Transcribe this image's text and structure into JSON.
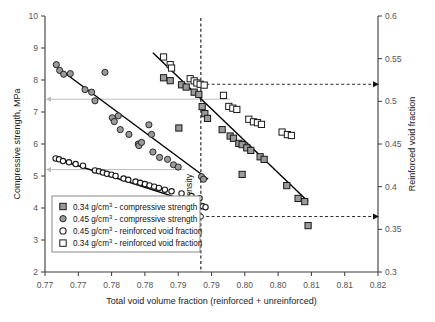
{
  "chart_data": {
    "type": "scatter",
    "title": "",
    "xlabel": "Total void volume fraction (reinforced + unreinforced)",
    "ylabel": "Compressive strength, MPa",
    "y2label": "Reinforced void fraction",
    "xlim": [
      0.77,
      0.82
    ],
    "ylim": [
      2,
      10
    ],
    "y2lim": [
      0.3,
      0.6
    ],
    "xticks": [
      "0.77",
      "0.77",
      "0.78",
      "0.78",
      "0.79",
      "0.79",
      "0.80",
      "0.80",
      "0.81",
      "0.81",
      "0.82"
    ],
    "xtick_values": [
      0.77,
      0.775,
      0.78,
      0.785,
      0.79,
      0.795,
      0.8,
      0.805,
      0.81,
      0.815,
      0.82
    ],
    "yticks": [
      "2",
      "3",
      "4",
      "5",
      "6",
      "7",
      "8",
      "9",
      "10"
    ],
    "ytick_values": [
      2,
      3,
      4,
      5,
      6,
      7,
      8,
      9,
      10
    ],
    "y2ticks": [
      "0.3",
      "0.35",
      "0.4",
      "0.45",
      "0.5",
      "0.55",
      "0.6"
    ],
    "y2tick_values": [
      0.3,
      0.35,
      0.4,
      0.45,
      0.5,
      0.55,
      0.6
    ],
    "grid": false,
    "legend_position": "lower-left",
    "annotations": [
      {
        "name": "constant-density-line",
        "text": "Constant density",
        "x": 0.7934,
        "orientation": "vertical-dashed"
      },
      {
        "name": "upper-guide",
        "from_x": 0.7934,
        "to_axis": "right",
        "y2_value": 0.52
      },
      {
        "name": "lower-guide",
        "from_x": 0.7934,
        "to_axis": "right",
        "y2_value": 0.365
      },
      {
        "name": "upper-left-guide",
        "to_axis": "left",
        "y_value": 7.4
      },
      {
        "name": "lower-left-guide",
        "to_axis": "left",
        "y_value": 5.2
      }
    ],
    "series": [
      {
        "name": "0.34 g/cm³ - compressive strength",
        "marker": "filled-square",
        "color": "#9a9a9a",
        "axis": "left",
        "points": [
          [
            0.7878,
            8.07
          ],
          [
            0.7888,
            7.98
          ],
          [
            0.7905,
            7.85
          ],
          [
            0.7912,
            7.78
          ],
          [
            0.7924,
            7.62
          ],
          [
            0.7931,
            7.55
          ],
          [
            0.7936,
            7.17
          ],
          [
            0.794,
            6.95
          ],
          [
            0.7944,
            6.8
          ],
          [
            0.7901,
            6.5
          ],
          [
            0.7966,
            6.45
          ],
          [
            0.7978,
            6.25
          ],
          [
            0.7983,
            6.18
          ],
          [
            0.7991,
            6.02
          ],
          [
            0.7996,
            5.98
          ],
          [
            0.8003,
            5.88
          ],
          [
            0.8009,
            5.8
          ],
          [
            0.8023,
            5.6
          ],
          [
            0.8029,
            5.52
          ],
          [
            0.7996,
            5.05
          ],
          [
            0.8063,
            4.7
          ],
          [
            0.808,
            4.3
          ],
          [
            0.809,
            4.2
          ],
          [
            0.8095,
            3.45
          ]
        ]
      },
      {
        "name": "0.45 g/cm³ - compressive strength",
        "marker": "filled-circle",
        "color": "#9a9a9a",
        "axis": "left",
        "points": [
          [
            0.7717,
            8.48
          ],
          [
            0.7722,
            8.3
          ],
          [
            0.7728,
            8.18
          ],
          [
            0.7738,
            8.2
          ],
          [
            0.776,
            7.7
          ],
          [
            0.777,
            7.62
          ],
          [
            0.779,
            8.24
          ],
          [
            0.7775,
            7.35
          ],
          [
            0.7801,
            6.82
          ],
          [
            0.7804,
            6.7
          ],
          [
            0.781,
            6.88
          ],
          [
            0.7813,
            6.45
          ],
          [
            0.7826,
            6.3
          ],
          [
            0.784,
            6.0
          ],
          [
            0.7841,
            5.95
          ],
          [
            0.7845,
            6.05
          ],
          [
            0.7856,
            6.6
          ],
          [
            0.786,
            6.3
          ],
          [
            0.7862,
            5.75
          ],
          [
            0.7872,
            5.58
          ],
          [
            0.7884,
            5.52
          ],
          [
            0.7893,
            5.35
          ],
          [
            0.79,
            5.28
          ],
          [
            0.7935,
            4.98
          ],
          [
            0.7938,
            4.9
          ]
        ]
      },
      {
        "name": "0.45 g/cm³ - reinforced void fraction",
        "marker": "open-circle",
        "color": "#ffffff",
        "axis": "right",
        "points": [
          [
            0.7716,
            0.433
          ],
          [
            0.7721,
            0.432
          ],
          [
            0.7727,
            0.43
          ],
          [
            0.7736,
            0.4285
          ],
          [
            0.7746,
            0.4265
          ],
          [
            0.7757,
            0.4245
          ],
          [
            0.7775,
            0.419
          ],
          [
            0.7781,
            0.418
          ],
          [
            0.7787,
            0.4165
          ],
          [
            0.7793,
            0.415
          ],
          [
            0.78,
            0.414
          ],
          [
            0.7806,
            0.4125
          ],
          [
            0.7818,
            0.4095
          ],
          [
            0.7825,
            0.408
          ],
          [
            0.7836,
            0.406
          ],
          [
            0.7843,
            0.4045
          ],
          [
            0.785,
            0.403
          ],
          [
            0.7857,
            0.4015
          ],
          [
            0.7864,
            0.4
          ],
          [
            0.7871,
            0.3985
          ],
          [
            0.788,
            0.3965
          ],
          [
            0.789,
            0.3945
          ],
          [
            0.7905,
            0.392
          ],
          [
            0.792,
            0.389
          ],
          [
            0.7932,
            0.3865
          ],
          [
            0.7937,
            0.377
          ],
          [
            0.7941,
            0.376
          ]
        ]
      },
      {
        "name": "0.34 g/cm³ - reinforced void fraction",
        "marker": "open-square",
        "color": "#ffffff",
        "axis": "right",
        "points": [
          [
            0.7878,
            0.552
          ],
          [
            0.7888,
            0.543
          ],
          [
            0.789,
            0.539
          ],
          [
            0.7918,
            0.5265
          ],
          [
            0.7924,
            0.524
          ],
          [
            0.7928,
            0.5215
          ],
          [
            0.7933,
            0.52
          ],
          [
            0.7939,
            0.519
          ],
          [
            0.7968,
            0.507
          ],
          [
            0.7976,
            0.494
          ],
          [
            0.7982,
            0.492
          ],
          [
            0.7988,
            0.4905
          ],
          [
            0.8006,
            0.479
          ],
          [
            0.8013,
            0.476
          ],
          [
            0.8019,
            0.475
          ],
          [
            0.8025,
            0.473
          ],
          [
            0.8056,
            0.464
          ],
          [
            0.8064,
            0.461
          ],
          [
            0.807,
            0.46
          ]
        ]
      }
    ],
    "trendlines": [
      {
        "name": "trend-0.45-compressive",
        "axis": "left",
        "x1": 0.7718,
        "y1": 8.4,
        "x2": 0.7945,
        "y2": 4.9
      },
      {
        "name": "trend-0.34-compressive",
        "axis": "left",
        "x1": 0.7862,
        "y1": 8.85,
        "x2": 0.8095,
        "y2": 4.2
      },
      {
        "name": "trend-0.45-voidfraction",
        "axis": "right",
        "x1": 0.7716,
        "y1": 0.433,
        "x2": 0.7942,
        "y2": 0.376
      }
    ]
  },
  "legend": {
    "items": [
      {
        "marker": "filled-square",
        "density": "0.34",
        "unit": "g/cm",
        "exp": "3",
        "label": " - compressive strength"
      },
      {
        "marker": "filled-circle",
        "density": "0.45",
        "unit": "g/cm",
        "exp": "3",
        "label": " - compressive strength"
      },
      {
        "marker": "open-circle",
        "density": "0.45",
        "unit": "g/cm",
        "exp": "3",
        "label": " - reinforced void fraction"
      },
      {
        "marker": "open-square",
        "density": "0.34",
        "unit": "g/cm",
        "exp": "3",
        "label": " - reinforced void fraction"
      }
    ]
  },
  "colors": {
    "marker_fill": "#9a9a9a",
    "marker_stroke": "#1a1a1a",
    "axis": "#3a3a3a",
    "tick_text": "#555555",
    "guide_line": "#bbbbbb",
    "trend": "#000000"
  }
}
